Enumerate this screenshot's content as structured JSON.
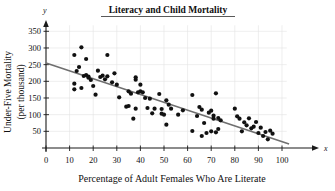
{
  "chart_data": {
    "type": "scatter",
    "title": "Literacy and Child Mortality",
    "xlabel": "Percentage of Adult Females Who Are Literate",
    "ylabel": "Under-Five Mortality (per thousand)",
    "ylabel_line1": "Under-Five Mortality",
    "ylabel_line2": "(per thousand)",
    "x_axis_symbol": "x",
    "y_axis_symbol": "y",
    "xlim": [
      0,
      103
    ],
    "ylim": [
      0,
      375
    ],
    "xticks": [
      0,
      10,
      20,
      30,
      40,
      50,
      60,
      70,
      80,
      90,
      100
    ],
    "yticks": [
      50,
      100,
      150,
      200,
      250,
      300,
      350
    ],
    "grid": true,
    "legend": false,
    "point_color": "#111111",
    "trend_color": "#6f6f6f",
    "grid_color": "#e2e2e2",
    "axis_color": "#1a1a1a",
    "trend_line": {
      "name": "least-squares regression line",
      "x_start": 0,
      "y_start": 255,
      "x_end": 103,
      "y_end": 12,
      "slope": -2.36,
      "intercept": 255
    },
    "series": [
      {
        "name": "Countries",
        "points": [
          [
            12,
            279
          ],
          [
            12,
            193
          ],
          [
            12,
            176
          ],
          [
            13,
            231
          ],
          [
            14,
            243
          ],
          [
            15,
            302
          ],
          [
            15,
            180
          ],
          [
            16,
            216
          ],
          [
            17,
            267
          ],
          [
            17,
            219
          ],
          [
            18,
            214
          ],
          [
            18,
            211
          ],
          [
            19,
            204
          ],
          [
            20,
            186
          ],
          [
            21,
            160
          ],
          [
            22,
            232
          ],
          [
            23,
            213
          ],
          [
            24,
            217
          ],
          [
            25,
            206
          ],
          [
            26,
            279
          ],
          [
            26,
            215
          ],
          [
            28,
            197
          ],
          [
            29,
            224
          ],
          [
            30,
            190
          ],
          [
            31,
            152
          ],
          [
            34,
            124
          ],
          [
            35,
            170
          ],
          [
            35,
            126
          ],
          [
            36,
            163
          ],
          [
            37,
            88
          ],
          [
            38,
            212
          ],
          [
            38,
            205
          ],
          [
            38,
            118
          ],
          [
            39,
            167
          ],
          [
            40,
            190
          ],
          [
            40,
            170
          ],
          [
            41,
            167
          ],
          [
            42,
            150
          ],
          [
            43,
            120
          ],
          [
            44,
            148
          ],
          [
            45,
            104
          ],
          [
            46,
            118
          ],
          [
            48,
            162
          ],
          [
            49,
            117
          ],
          [
            49,
            103
          ],
          [
            50,
            100
          ],
          [
            51,
            143
          ],
          [
            51,
            70
          ],
          [
            52,
            130
          ],
          [
            53,
            118
          ],
          [
            56,
            100
          ],
          [
            58,
            113
          ],
          [
            62,
            159
          ],
          [
            62,
            51
          ],
          [
            64,
            96
          ],
          [
            65,
            123
          ],
          [
            66,
            115
          ],
          [
            66,
            36
          ],
          [
            67,
            75
          ],
          [
            68,
            45
          ],
          [
            69,
            106
          ],
          [
            70,
            112
          ],
          [
            70,
            50
          ],
          [
            71,
            97
          ],
          [
            71,
            88
          ],
          [
            72,
            164
          ],
          [
            72,
            47
          ],
          [
            73,
            90
          ],
          [
            73,
            57
          ],
          [
            74,
            83
          ],
          [
            80,
            118
          ],
          [
            81,
            95
          ],
          [
            82,
            88
          ],
          [
            83,
            50
          ],
          [
            84,
            77
          ],
          [
            85,
            68
          ],
          [
            86,
            89
          ],
          [
            87,
            59
          ],
          [
            88,
            64
          ],
          [
            89,
            78
          ],
          [
            90,
            45
          ],
          [
            91,
            61
          ],
          [
            92,
            36
          ],
          [
            93,
            48
          ],
          [
            94,
            26
          ],
          [
            95,
            52
          ],
          [
            96,
            43
          ]
        ]
      }
    ]
  },
  "plot": {
    "geometry": {
      "origin_x_px": 46,
      "origin_y_px": 148,
      "x_unit_px": 2.36,
      "y_unit_px": 0.3334
    }
  }
}
